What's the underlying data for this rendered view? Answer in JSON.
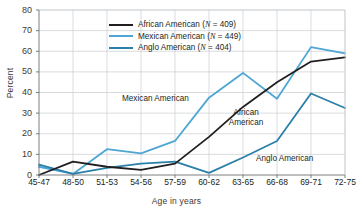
{
  "chart_data": {
    "type": "line",
    "title": "",
    "subtitle": "",
    "xlabel": "Age in years",
    "ylabel": "Percent",
    "categories": [
      "45-47",
      "48-50",
      "51-53",
      "54-56",
      "57-59",
      "60-62",
      "63-65",
      "66-68",
      "69-71",
      "72-75"
    ],
    "ylim": [
      0,
      80
    ],
    "yticks": [
      0,
      10,
      20,
      30,
      40,
      50,
      60,
      70,
      80
    ],
    "grid": true,
    "legend_position": "upper-center",
    "series": [
      {
        "name": "African American",
        "n": 409,
        "legend_label": "African American (N = 409)",
        "color": "#231f20",
        "values": [
          0,
          6.5,
          4,
          2.5,
          5.5,
          18.5,
          33,
          45,
          55,
          57
        ]
      },
      {
        "name": "Mexican American",
        "n": 449,
        "legend_label": "Mexican American (N = 449)",
        "color": "#4da6d4",
        "values": [
          4,
          0.5,
          12.5,
          10.5,
          16.5,
          37.5,
          49.5,
          37,
          62,
          59
        ]
      },
      {
        "name": "Anglo American",
        "n": 404,
        "legend_label": "Anglo American (N = 404)",
        "color": "#2b7fa8",
        "values": [
          5,
          0.5,
          3.5,
          5.5,
          6.5,
          1,
          8.5,
          16.5,
          39.5,
          32.5
        ]
      }
    ],
    "annotations": [
      {
        "text": "Mexican American",
        "x": 122,
        "y": 94
      },
      {
        "text": "African American",
        "x": 219,
        "y": 108,
        "two_line": true
      },
      {
        "text": "Anglo American",
        "x": 256,
        "y": 154
      }
    ]
  },
  "legend": {
    "rows": [
      {
        "label_prefix": "African American (",
        "n_text": "N",
        "label_suffix": " = 409)"
      },
      {
        "label_prefix": "Mexican American (",
        "n_text": "N",
        "label_suffix": " = 449)"
      },
      {
        "label_prefix": "Anglo American (",
        "n_text": "N",
        "label_suffix": " = 404)"
      }
    ]
  }
}
